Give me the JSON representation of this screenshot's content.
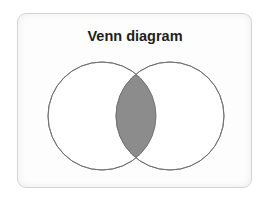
{
  "title": "Venn diagram",
  "diagram": {
    "sets": [
      {
        "name": "set-a",
        "label": ""
      },
      {
        "name": "set-b",
        "label": ""
      }
    ],
    "intersection": {
      "shaded": true
    },
    "colors": {
      "outline": "#6e6e6e",
      "intersection_fill": "#8c8c8c",
      "circle_fill": "#ffffff"
    }
  }
}
